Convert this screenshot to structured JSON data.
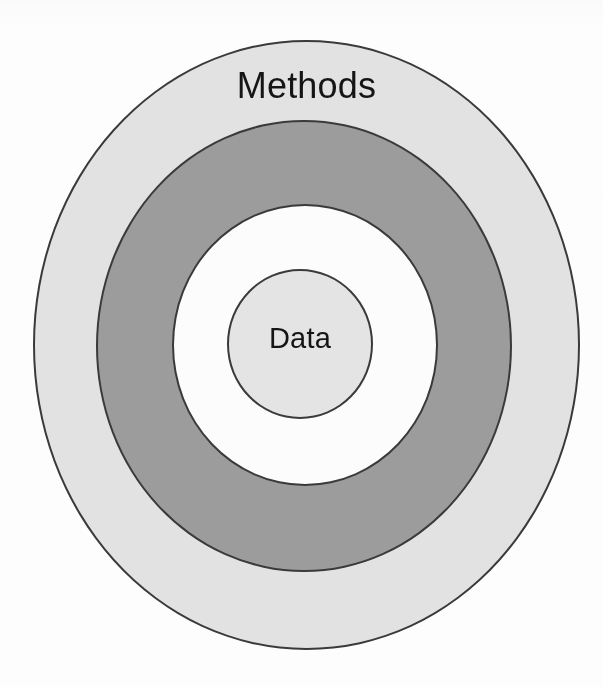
{
  "diagram": {
    "type": "concentric-rings",
    "title": "",
    "background_color": "#fdfdfd",
    "outline_color": "#3a3a3a",
    "rings": [
      {
        "id": "methods",
        "label": "Methods",
        "level": 1,
        "position": "outer",
        "fill_color": "#e2e2e2",
        "fill_name": "light-gray",
        "label_position": "top-inside"
      },
      {
        "id": "band-dark",
        "label": "",
        "level": 2,
        "position": "second",
        "fill_color": "#9c9c9c",
        "fill_name": "dark-gray",
        "label_position": "none"
      },
      {
        "id": "band-light",
        "label": "",
        "level": 3,
        "position": "third",
        "fill_color": "#fcfcfc",
        "fill_name": "white",
        "label_position": "none"
      },
      {
        "id": "data",
        "label": "Data",
        "level": 4,
        "position": "center",
        "fill_color": "#e4e4e4",
        "fill_name": "light-gray",
        "label_position": "center"
      }
    ]
  }
}
